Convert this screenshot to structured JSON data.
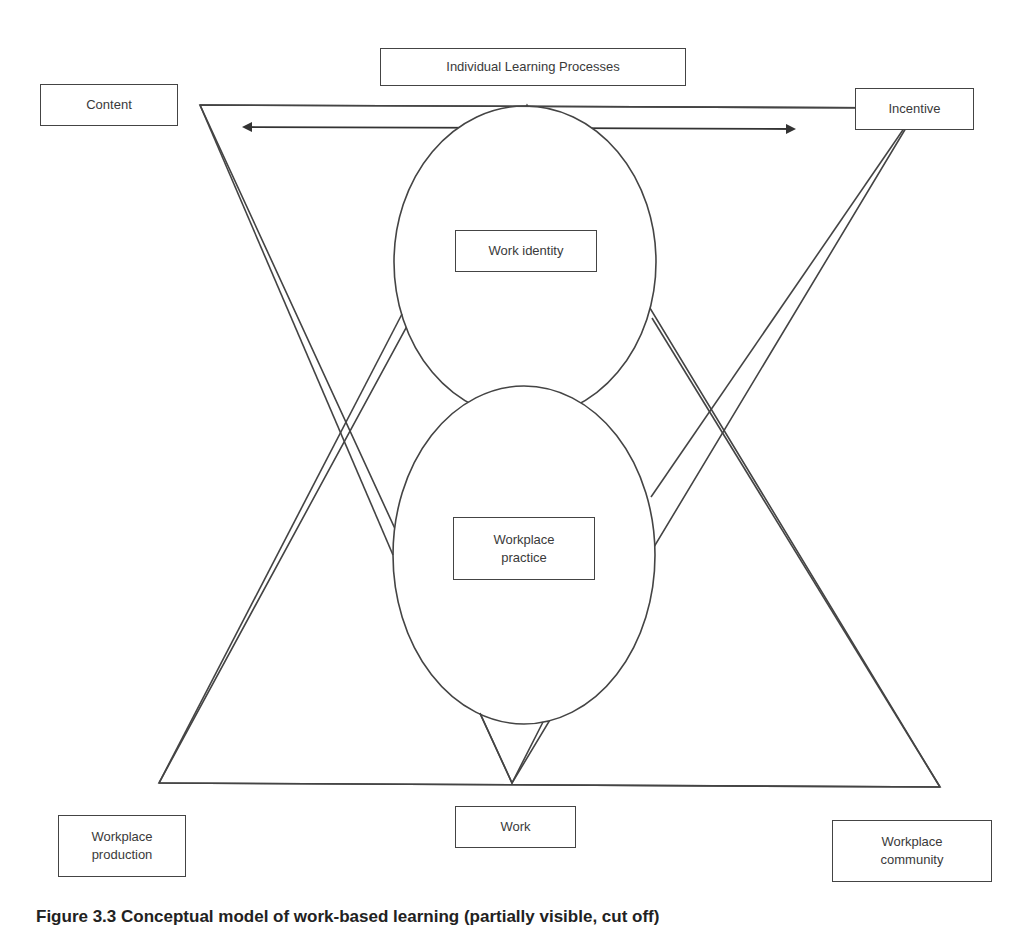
{
  "figure": {
    "labels": {
      "top": "Individual Learning Processes",
      "top_left": "Content",
      "top_right": "Incentive",
      "upper_oval": "Work identity",
      "lower_oval": "Workplace\npractice",
      "bottom_center": "Work",
      "bottom_left": "Workplace\nproduction",
      "bottom_right": "Workplace\ncommunity"
    },
    "caption": "Figure 3.3  Conceptual model of work-based learning (partially visible, cut off)",
    "colors": {
      "line": "#444444",
      "text": "#3a3a3a",
      "background": "#ffffff"
    },
    "arrow": {
      "type": "double-headed",
      "orientation": "horizontal"
    }
  }
}
